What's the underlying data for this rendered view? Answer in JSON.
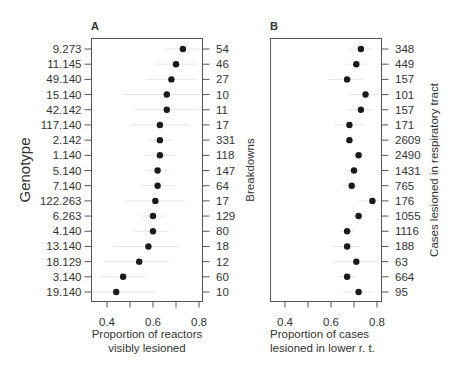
{
  "chart_data": [
    {
      "type": "scatter",
      "panel": "A",
      "title": "A",
      "xlabel": [
        "Proportion of reactors",
        "visibly lesioned"
      ],
      "ylabel": "Genotype",
      "right_ylabel": "Breakdowns",
      "xlim": [
        0.34,
        0.81
      ],
      "xticks": [
        0.4,
        0.5,
        0.6,
        0.7,
        0.8
      ],
      "xtick_labels": [
        "0.4",
        "",
        "0.6",
        "",
        "0.8"
      ],
      "grid": false,
      "categories": [
        "9.273",
        "11.145",
        "49.140",
        "15.140",
        "42.142",
        "117.140",
        "2.142",
        "1.140",
        "5.140",
        "7.140",
        "122.263",
        "6.263",
        "4.140",
        "13.140",
        "18.129",
        "3.140",
        "19.140"
      ],
      "right_labels": [
        "54",
        "46",
        "27",
        "10",
        "11",
        "17",
        "331",
        "118",
        "147",
        "64",
        "17",
        "129",
        "80",
        "18",
        "12",
        "60",
        "10"
      ],
      "values": [
        0.73,
        0.7,
        0.68,
        0.66,
        0.66,
        0.63,
        0.63,
        0.63,
        0.62,
        0.62,
        0.61,
        0.6,
        0.6,
        0.58,
        0.54,
        0.47,
        0.44
      ],
      "ci_low": [
        0.65,
        0.61,
        0.57,
        0.47,
        0.51,
        0.5,
        0.58,
        0.56,
        0.57,
        0.55,
        0.48,
        0.55,
        0.52,
        0.43,
        0.39,
        0.37,
        0.29
      ],
      "ci_high": [
        0.8,
        0.79,
        0.79,
        0.82,
        0.8,
        0.76,
        0.68,
        0.7,
        0.67,
        0.69,
        0.74,
        0.65,
        0.67,
        0.71,
        0.67,
        0.57,
        0.61
      ]
    },
    {
      "type": "scatter",
      "panel": "B",
      "title": "B",
      "xlabel": [
        "Proportion of cases",
        "lesioned in lower r. t."
      ],
      "ylabel": "",
      "right_ylabel": "Cases lesioned in respiratory tract",
      "xlim": [
        0.34,
        0.83
      ],
      "xticks": [
        0.4,
        0.5,
        0.6,
        0.7,
        0.8
      ],
      "xtick_labels": [
        "0.4",
        "",
        "0.6",
        "",
        "0.8"
      ],
      "grid": false,
      "categories": [
        "9.273",
        "11.145",
        "49.140",
        "15.140",
        "42.142",
        "117.140",
        "2.142",
        "1.140",
        "5.140",
        "7.140",
        "122.263",
        "6.263",
        "4.140",
        "13.140",
        "18.129",
        "3.140",
        "19.140"
      ],
      "right_labels": [
        "348",
        "449",
        "157",
        "101",
        "157",
        "171",
        "2609",
        "2490",
        "1431",
        "765",
        "176",
        "1055",
        "1116",
        "188",
        "63",
        "664",
        "95"
      ],
      "values": [
        0.73,
        0.71,
        0.67,
        0.75,
        0.73,
        0.68,
        0.68,
        0.72,
        0.7,
        0.69,
        0.78,
        0.72,
        0.67,
        0.67,
        0.71,
        0.67,
        0.72
      ],
      "ci_low": [
        0.68,
        0.66,
        0.59,
        0.68,
        0.67,
        0.61,
        0.66,
        0.7,
        0.67,
        0.65,
        0.72,
        0.69,
        0.64,
        0.61,
        0.61,
        0.63,
        0.65
      ],
      "ci_high": [
        0.78,
        0.75,
        0.74,
        0.81,
        0.78,
        0.75,
        0.7,
        0.74,
        0.72,
        0.72,
        0.83,
        0.75,
        0.7,
        0.73,
        0.8,
        0.71,
        0.79
      ]
    }
  ],
  "style": {
    "dot_color": "#1a1a1a",
    "axis_color": "#555555",
    "ci_color": "#e6e6e6",
    "text_color": "#333333"
  }
}
